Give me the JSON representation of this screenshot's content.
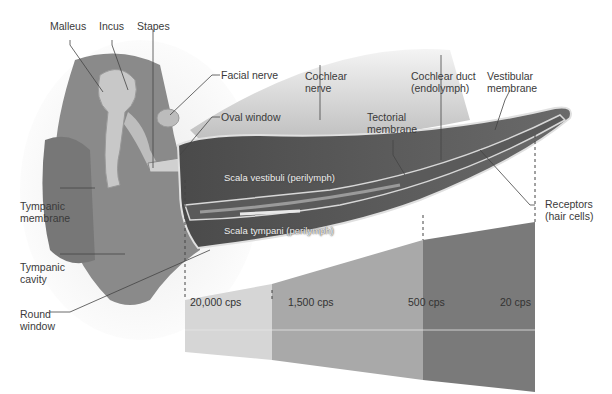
{
  "diagram": {
    "type": "anatomical-ear-cochlea",
    "labels": {
      "malleus": "Malleus",
      "incus": "Incus",
      "stapes": "Stapes",
      "facial_nerve": "Facial nerve",
      "oval_window": "Oval window",
      "cochlear_nerve_1": "Cochlear",
      "cochlear_nerve_2": "nerve",
      "cochlear_duct_1": "Cochlear duct",
      "cochlear_duct_2": "(endolymph)",
      "vestibular_membrane_1": "Vestibular",
      "vestibular_membrane_2": "membrane",
      "tectorial_membrane_1": "Tectorial",
      "tectorial_membrane_2": "membrane",
      "tympanic_membrane_1": "Tympanic",
      "tympanic_membrane_2": "membrane",
      "tympanic_cavity_1": "Tympanic",
      "tympanic_cavity_2": "cavity",
      "round_window_1": "Round",
      "round_window_2": "window",
      "receptors_1": "Receptors",
      "receptors_2": "(hair cells)",
      "scala_vestibuli": "Scala vestibuli (perilymph)",
      "scala_tympani": "Scala tympani (perilymph)"
    },
    "frequency_bands": [
      {
        "label": "20,000 cps",
        "color": "#d6d6d6"
      },
      {
        "label": "1,500 cps",
        "color": "#a9a9a9"
      },
      {
        "label": "500 cps",
        "color": "#7a7a7a"
      },
      {
        "label": "20 cps",
        "color": "#7a7a7a"
      }
    ]
  }
}
